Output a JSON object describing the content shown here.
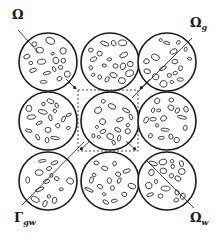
{
  "figure": {
    "stroke_color": "#1a1a1a",
    "background": "#ffffff"
  },
  "labels": {
    "omega": {
      "symbol": "Ω",
      "sub": ""
    },
    "omega_g": {
      "symbol": "Ω",
      "sub": "g"
    },
    "gamma_gw": {
      "symbol": "Γ",
      "sub": "gw"
    },
    "omega_w": {
      "symbol": "Ω",
      "sub": "w"
    }
  },
  "grid": {
    "rows": 3,
    "cols": 3,
    "centers_x": [
      48,
      110,
      167
    ],
    "centers_y": [
      62,
      121,
      181
    ],
    "radius": 29
  },
  "unit_cell": {
    "x": 78,
    "y": 90,
    "width": 60,
    "height": 61,
    "style": "dashed"
  }
}
